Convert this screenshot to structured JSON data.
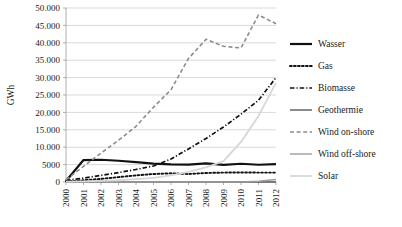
{
  "chart_data": {
    "type": "line",
    "title": "",
    "xlabel": "",
    "ylabel": "GWh",
    "x": [
      2000,
      2001,
      2002,
      2003,
      2004,
      2005,
      2006,
      2007,
      2008,
      2009,
      2010,
      2011,
      2012
    ],
    "categories": [
      "2000",
      "2001",
      "2002",
      "2003",
      "2004",
      "2005",
      "2006",
      "2007",
      "2008",
      "2009",
      "2010",
      "2011",
      "2012"
    ],
    "ylim": [
      0,
      50000
    ],
    "ytick_values": [
      0,
      5000,
      10000,
      15000,
      20000,
      25000,
      30000,
      35000,
      40000,
      45000,
      50000
    ],
    "ytick_labels": [
      "0",
      "5000",
      "10.000",
      "15.000",
      "20.000",
      "25.000",
      "30.000",
      "35.000",
      "40.000",
      "45.000",
      "50.000"
    ],
    "grid": true,
    "legend_position": "right",
    "series": [
      {
        "name": "Wasser",
        "color": "#111111",
        "dash": "none",
        "width": 2.2,
        "values": [
          300,
          6300,
          6400,
          6100,
          5700,
          5300,
          5050,
          5000,
          5350,
          4900,
          5250,
          4950,
          5150
        ]
      },
      {
        "name": "Gas",
        "color": "#111111",
        "dash": "dotted",
        "width": 1.9,
        "values": [
          200,
          500,
          900,
          1400,
          1900,
          2300,
          2500,
          2300,
          2600,
          2700,
          2750,
          2700,
          2700
        ]
      },
      {
        "name": "Biomasse",
        "color": "#111111",
        "dash": "dashdot",
        "width": 1.7,
        "values": [
          450,
          1100,
          1900,
          2700,
          3600,
          4600,
          6600,
          9500,
          12500,
          15800,
          19500,
          23500,
          30000
        ]
      },
      {
        "name": "Geothermie",
        "color": "#5a5a5a",
        "dash": "none",
        "width": 1.4,
        "values": [
          0,
          0,
          0,
          0,
          0,
          0,
          0,
          0,
          0,
          0,
          0,
          0,
          0
        ]
      },
      {
        "name": "Wind on-shore",
        "color": "#8c8c8c",
        "dash": "dashed",
        "width": 1.6,
        "values": [
          600,
          4500,
          8300,
          12000,
          16000,
          21500,
          26500,
          35500,
          41000,
          39000,
          38500,
          48000,
          45500
        ]
      },
      {
        "name": "Wind off-shore",
        "color": "#9d9d9d",
        "dash": "none",
        "width": 1.4,
        "values": [
          0,
          0,
          0,
          0,
          0,
          0,
          0,
          0,
          0,
          0,
          0,
          200,
          700
        ]
      },
      {
        "name": "Solar",
        "color": "#d7d7d7",
        "dash": "none",
        "width": 1.8,
        "values": [
          100,
          200,
          300,
          500,
          800,
          1200,
          1900,
          2900,
          4200,
          6000,
          11500,
          19000,
          28500
        ]
      }
    ]
  },
  "axes": {
    "ylabel": "GWh"
  }
}
